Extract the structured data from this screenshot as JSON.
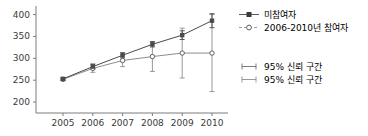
{
  "chart_data": {
    "type": "line",
    "title": "",
    "xlabel": "",
    "ylabel": "",
    "categories": [
      "2005",
      "2006",
      "2007",
      "2008",
      "2009",
      "2010"
    ],
    "x": [
      2005,
      2006,
      2007,
      2008,
      2009,
      2010
    ],
    "ylim": [
      175,
      415
    ],
    "yticks": [
      200,
      250,
      300,
      350,
      400
    ],
    "ytick_labels": [
      "200",
      "250",
      "300",
      "350",
      "400"
    ],
    "grid": false,
    "legend_position": "right",
    "series": [
      {
        "name": "미참여자",
        "marker": "filled-square",
        "values": [
          253,
          281,
          307,
          332,
          353,
          386
        ],
        "ci_lower": [
          250,
          275,
          301,
          326,
          343,
          370
        ],
        "ci_upper": [
          256,
          287,
          313,
          338,
          363,
          402
        ]
      },
      {
        "name": "2006-2010년 참여자",
        "marker": "open-circle",
        "values": [
          252,
          277,
          295,
          304,
          312,
          312
        ],
        "ci_lower": [
          249,
          268,
          281,
          270,
          255,
          224
        ],
        "ci_upper": [
          255,
          286,
          309,
          338,
          369,
          400
        ]
      }
    ],
    "ci_legend": [
      {
        "label": "95% 신뢰 구간",
        "series": "미참여자"
      },
      {
        "label": "95% 신뢰 구간",
        "series": "2006-2010년 참여자"
      }
    ]
  },
  "colors": {
    "axis": "#7d7d7d",
    "series1": "#4a4a4a",
    "series2": "#8d8d8d",
    "text": "#3a3a3a",
    "background": "#ffffff"
  }
}
